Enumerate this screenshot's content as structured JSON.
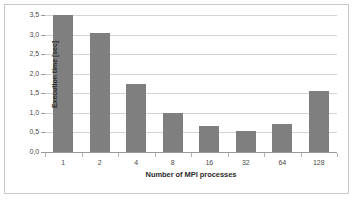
{
  "chart_data": {
    "type": "bar",
    "title": "",
    "xlabel": "Number of MPI processes",
    "ylabel": "Execution time [sec]",
    "categories": [
      "1",
      "2",
      "4",
      "8",
      "16",
      "32",
      "64",
      "128"
    ],
    "values": [
      3.5,
      3.05,
      1.73,
      1.0,
      0.67,
      0.53,
      0.72,
      1.56
    ],
    "series": [
      {
        "name": "Execution time",
        "values": [
          3.5,
          3.05,
          1.73,
          1.0,
          0.67,
          0.53,
          0.72,
          1.56
        ]
      }
    ],
    "ylim": [
      0.0,
      3.5
    ],
    "ytick_labels": [
      "0,0",
      "0,5",
      "1,0",
      "1,5",
      "2,0",
      "2,5",
      "3,0",
      "3,5"
    ],
    "ytick_values": [
      0.0,
      0.5,
      1.0,
      1.5,
      2.0,
      2.5,
      3.0,
      3.5
    ],
    "grid": true,
    "grid_axis": "y",
    "legend": false,
    "legend_position": "none",
    "bar_color": "#7f7f7f",
    "gridline_color": "#d4d4d4",
    "axis_color": "#9a9a9a",
    "background_color": "#ffffff",
    "decimal_separator": ","
  }
}
